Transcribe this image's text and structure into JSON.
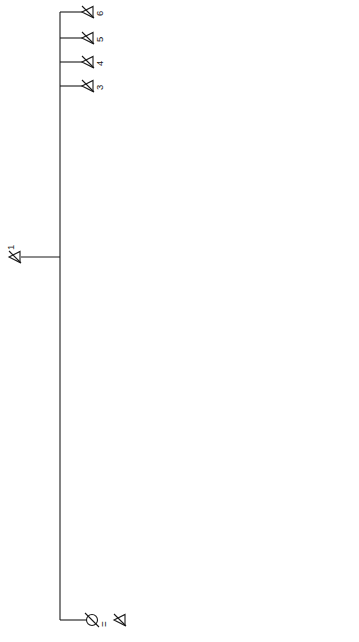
{
  "figure": {
    "caption": "Fig. 8. Lineage segment",
    "orientation": "rotated 90° (reads bottom-to-top)"
  },
  "wives": {
    "second": "2nd wife",
    "third": "3rd wife",
    "fourth": "4th wife",
    "fifth": "5th wife"
  },
  "numbers": {
    "n1": "1",
    "n2": "2",
    "n3": "3",
    "n4": "4",
    "n5": "5",
    "n6": "6",
    "n7": "7",
    "n8": "8",
    "n9": "9",
    "n10": "10",
    "n11": "11",
    "n12": "12",
    "n13": "13",
    "n14": "14",
    "n15": "15",
    "n16": "16",
    "n17": "17",
    "n18": "18",
    "n19": "19",
    "n20": "20",
    "n21": "21",
    "n22": "22",
    "n23": "23",
    "n24": "24",
    "n25": "25",
    "n26": "26",
    "n27": "27",
    "n28": "28",
    "n29": "29",
    "n30": "30",
    "n31": "31",
    "n32": "32",
    "n33": "33",
    "n34": "34",
    "n35": "35",
    "n36": "36",
    "n37": "37",
    "n38": "38",
    "n39": "39",
    "n40": "40",
    "n41": "41",
    "n42": "42",
    "n43": "43"
  },
  "key": {
    "title": "KEY",
    "items": [
      {
        "symbol": "crossed-triangle",
        "label": "Deceased married males"
      },
      {
        "symbol": "crossed-circle",
        "label": "Deceased married females"
      },
      {
        "symbol": "open-circle",
        "label": "Living married females"
      },
      {
        "symbol": "solid-triangle",
        "label": "Homestead heads"
      },
      {
        "symbol": "open-triangle",
        "label": "Married males, not homestead heads"
      }
    ],
    "marriage_symbol": "=",
    "marriage_label": "Marriage",
    "no_issue_line1": "without",
    "no_issue_line2": "male issue"
  },
  "colors": {
    "ink": "#1a1a1a",
    "background": "#ffffff",
    "caption": "#6a6a6a"
  }
}
